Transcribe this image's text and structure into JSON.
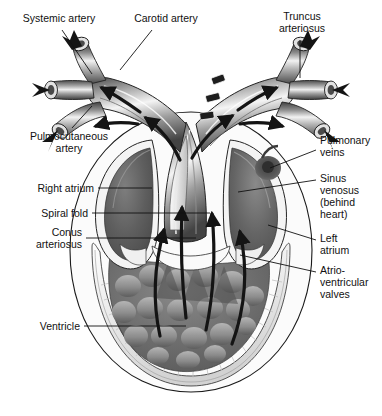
{
  "figure": {
    "background_color": "#ffffff",
    "ink_color": "#111111",
    "palette": {
      "vessel_light": "#e9e9e9",
      "vessel_mid": "#9a9a9a",
      "vessel_dark": "#4a4a4a",
      "chamber_dark": "#5c5c5c",
      "chamber_mid": "#7d7d7d",
      "myocardium_light": "#f1f1f1",
      "ventricle_gray": "#6f6f6f",
      "arrow_black": "#141414"
    }
  },
  "labels": {
    "systemic_artery": "Systemic artery",
    "carotid_artery": "Carotid artery",
    "truncus_arteriosus": "Truncus\narteriosus",
    "pulmocutaneous_artery": "Pulmocutaneous\nartery",
    "right_atrium": "Right atrium",
    "spiral_fold": "Spiral fold",
    "conus_arteriosus": "Conus\narteriosus",
    "ventricle": "Ventricle",
    "pulmonary_veins": "Pulmonary\nveins",
    "sinus_venosus": "Sinus\nvenosus\n(behind\nheart)",
    "left_atrium": "Left\natrium",
    "atrioventricular_valves": "Atrio-\nventricular\nvalves"
  },
  "structures": [
    {
      "name": "systemic-artery",
      "side": "both",
      "type": "cut-vessel"
    },
    {
      "name": "carotid-artery",
      "side": "both",
      "type": "cut-vessel"
    },
    {
      "name": "pulmocutaneous-artery",
      "side": "both",
      "type": "cut-vessel"
    },
    {
      "name": "truncus-arteriosus",
      "side": "both",
      "type": "trunk"
    },
    {
      "name": "conus-arteriosus",
      "side": "center",
      "type": "chamber"
    },
    {
      "name": "spiral-fold",
      "side": "center",
      "type": "ridge"
    },
    {
      "name": "right-atrium",
      "side": "left",
      "type": "chamber"
    },
    {
      "name": "left-atrium",
      "side": "right",
      "type": "chamber"
    },
    {
      "name": "sinus-venosus",
      "side": "right",
      "type": "chamber"
    },
    {
      "name": "pulmonary-veins",
      "side": "right",
      "type": "vessel"
    },
    {
      "name": "atrioventricular-valves",
      "side": "center",
      "type": "valve"
    },
    {
      "name": "ventricle",
      "side": "center",
      "type": "chamber"
    }
  ],
  "flow_arrows": {
    "count": 14,
    "color": "#141414",
    "description": "Black arrows showing blood flow from ventricle through conus arteriosus and truncus arteriosus out the paired carotid, systemic and pulmocutaneous arteries"
  }
}
